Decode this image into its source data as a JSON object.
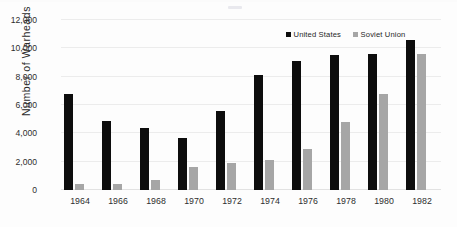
{
  "chart_data": {
    "type": "bar",
    "title": "",
    "subtitle": "",
    "xlabel": "",
    "ylabel": "Number of  Warheads",
    "categories": [
      "1964",
      "1966",
      "1968",
      "1970",
      "1972",
      "1974",
      "1976",
      "1978",
      "1980",
      "1982"
    ],
    "series": [
      {
        "name": "United States",
        "color": "#0d0d0d",
        "values": [
          6800,
          4900,
          4400,
          3700,
          5600,
          8100,
          9100,
          9500,
          9600,
          10600
        ]
      },
      {
        "name": "Soviet Union",
        "color": "#a6a6a6",
        "values": [
          450,
          450,
          700,
          1600,
          1900,
          2150,
          2900,
          4800,
          6800,
          9600
        ]
      }
    ],
    "ylim": [
      0,
      12000
    ],
    "y_ticks": [
      0,
      2000,
      4000,
      6000,
      8000,
      10000,
      12000
    ],
    "y_tick_labels": [
      "0",
      "2,000",
      "4,000",
      "6,000",
      "8,000",
      "10,000",
      "12,000"
    ],
    "grid": true,
    "grid_axis": "y",
    "legend_position": "top-right",
    "legend_entries": [
      "United States",
      "Soviet Union"
    ],
    "bar_mode": "grouped"
  },
  "axes": {
    "y_title": "Number of  Warheads"
  },
  "legend": {
    "items": [
      {
        "label": "United States",
        "swatch_name": "legend-swatch-united-states"
      },
      {
        "label": "Soviet Union",
        "swatch_name": "legend-swatch-soviet-union"
      }
    ]
  }
}
